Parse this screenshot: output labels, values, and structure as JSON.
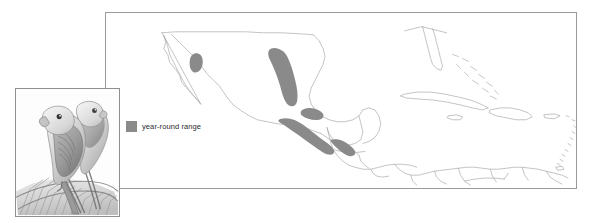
{
  "figure": {
    "type": "range-map",
    "region": "Mexico, Central America and the Caribbean"
  },
  "legend": {
    "label": "year-round range",
    "swatch_color": "#8a8a8a",
    "swatch_icon": "filled-square-icon"
  },
  "map": {
    "frame_color": "#9a9a9a",
    "background": "#ffffff",
    "coastline_color": "#a8a8a8",
    "border_color": "#b8b8b8",
    "range_fill": "#8a8a8a",
    "range_patches": [
      {
        "name": "northwest-mexico-oval",
        "description": "small isolated oval in the Sierra Madre Occidental"
      },
      {
        "name": "sierra-madre-oriental-band",
        "description": "large elongated band along eastern Mexico"
      },
      {
        "name": "isthmus-tehuantepec-patch",
        "description": "patch near the Isthmus of Tehuantepec"
      },
      {
        "name": "pacific-slope-band",
        "description": "continuous band along the Pacific slope of Chiapas and Guatemala"
      },
      {
        "name": "central-america-band",
        "description": "band continuing through Honduras, El Salvador and Nicaragua"
      }
    ],
    "landmasses": [
      "Baja California",
      "Mexico",
      "Florida",
      "Cuba",
      "Bahamas",
      "Jamaica",
      "Hispaniola",
      "Puerto Rico",
      "Lesser Antilles",
      "Guatemala",
      "Belize",
      "Honduras",
      "El Salvador",
      "Nicaragua",
      "Costa Rica",
      "Panama",
      "Colombia",
      "Venezuela",
      "Guyana",
      "Trinidad"
    ]
  },
  "illustration": {
    "title": "parrot pair on palm fronds",
    "medium": "pencil drawing",
    "border_color": "#8f8f8f",
    "subjects": [
      {
        "name": "parrot-foreground",
        "description": "parrot perched facing left with long tail"
      },
      {
        "name": "parrot-background",
        "description": "second parrot standing behind"
      },
      {
        "name": "palm-fronds",
        "description": "palm fronds forming the perch"
      }
    ]
  }
}
